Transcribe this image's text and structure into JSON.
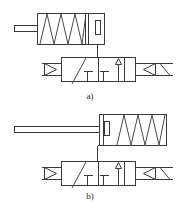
{
  "figure": {
    "kind": "hydraulic-pneumatic-circuit-schematic",
    "background_color": "#ffffff",
    "line_color": "#3a3a3a",
    "width": 186,
    "height": 209,
    "panels": [
      {
        "id": "a",
        "caption": "a)",
        "caption_x": 90,
        "caption_y": 98,
        "cylinder": {
          "name": "single-acting-spring-return-cylinder",
          "rod_side": "left",
          "spring_position": "left-chamber",
          "piston_position": "right",
          "body": {
            "x": 37,
            "y": 13,
            "w": 67,
            "h": 31
          },
          "rod": {
            "x": 14,
            "y": 25,
            "w": 23,
            "h": 6
          },
          "spring": {
            "x": 39,
            "y": 14,
            "w": 46,
            "h": 29,
            "coils": 4
          },
          "piston": {
            "x": 85,
            "y": 14,
            "w": 4,
            "h": 29
          },
          "port_line": {
            "x": 97,
            "y_from": 44,
            "y_to": 57
          },
          "cap_detail": {
            "x": 95,
            "y": 20,
            "w": 5,
            "h": 14
          }
        },
        "valve": {
          "name": "3-2-way-directional-control-valve",
          "positions": 2,
          "body": {
            "x": 61,
            "y": 57,
            "w": 74,
            "h": 24
          },
          "divider_x": 98,
          "left_cell_symbol": "diagonal-crossover-with-blocked-port",
          "right_cell_symbol": "straight-through-with-up-arrow",
          "supply_triangle": {
            "x": 41,
            "y": 62,
            "w": 16,
            "h": 14
          },
          "actuator_left": "air-pilot-inlet-arrow",
          "actuator_right_symbols": [
            "solenoid-coil-arrow",
            "spring-return-diagonal"
          ],
          "pilot_line": {
            "from_x": 97,
            "from_y": 44,
            "to_x": 97,
            "to_y": 57
          }
        }
      },
      {
        "id": "b",
        "caption": "b)",
        "caption_x": 90,
        "caption_y": 198,
        "cylinder": {
          "name": "single-acting-spring-return-cylinder",
          "rod_side": "left",
          "spring_position": "right-chamber",
          "piston_position": "left",
          "body": {
            "x": 99,
            "y": 117,
            "w": 67,
            "h": 31
          },
          "rod": {
            "x": 14,
            "y": 129,
            "w": 85,
            "h": 6
          },
          "spring": {
            "x": 114,
            "y": 118,
            "w": 46,
            "h": 29,
            "coils": 4
          },
          "piston": {
            "x": 100,
            "y": 118,
            "w": 4,
            "h": 29
          },
          "port_line": {
            "x": 97,
            "y_from": 148,
            "y_to": 161
          },
          "cap_detail": {
            "x": 99,
            "y": 120,
            "w": 5,
            "h": 14
          }
        },
        "valve": {
          "name": "3-2-way-directional-control-valve",
          "positions": 2,
          "body": {
            "x": 61,
            "y": 161,
            "w": 74,
            "h": 24
          },
          "divider_x": 98,
          "left_cell_symbol": "diagonal-crossover-with-blocked-port",
          "right_cell_symbol": "straight-through-with-up-arrow",
          "supply_triangle": {
            "x": 41,
            "y": 166,
            "w": 16,
            "h": 14
          },
          "actuator_left": "air-pilot-inlet-arrow",
          "actuator_right_symbols": [
            "solenoid-coil-arrow",
            "spring-return-diagonal"
          ],
          "pilot_line": {
            "from_x": 97,
            "from_y": 148,
            "to_x": 97,
            "to_y": 161
          }
        }
      }
    ]
  }
}
